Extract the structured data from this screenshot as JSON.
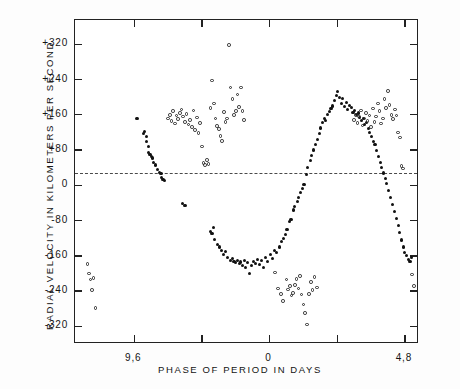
{
  "chart_data": {
    "type": "scatter",
    "title": "",
    "xlabel": "PHASE OF PERIOD IN DAYS",
    "ylabel": "RADIAL VELOCITY IN KILOMETERS PER SECOND",
    "right_label_top": "RECESSION",
    "right_label_bottom": "APPROACH",
    "grid": false,
    "legend": "none",
    "xlim": [
      7.5,
      19.7
    ],
    "ylim": [
      -360,
      375
    ],
    "xticks_values": [
      9.6,
      12.0,
      14.4,
      16.8,
      9.6,
      12.0,
      14.4,
      16.8,
      19.2
    ],
    "xtick_labels": [
      "9,6",
      "0",
      "4,8",
      "9,6",
      "14,4"
    ],
    "xtick_label_positions": [
      9.6,
      14.4,
      19.2,
      24.0,
      28.8
    ],
    "ytick_labels": [
      "+320",
      "+240",
      "+160",
      "+80",
      "0",
      "-80",
      "-160",
      "-240",
      "-320"
    ],
    "ytick_values": [
      320,
      240,
      160,
      80,
      0,
      -80,
      -160,
      -240,
      -320
    ],
    "reference_line": {
      "y": 28,
      "style": "dashed",
      "label": ""
    },
    "series": [
      {
        "name": "filled",
        "marker": "filled-circle",
        "color": "#111111",
        "points": [
          [
            9.7,
            152
          ],
          [
            9.92,
            118
          ],
          [
            9.98,
            122
          ],
          [
            10.02,
            110
          ],
          [
            10.05,
            100
          ],
          [
            10.12,
            74
          ],
          [
            10.16,
            70
          ],
          [
            10.2,
            66
          ],
          [
            10.25,
            62
          ],
          [
            10.1,
            88
          ],
          [
            10.3,
            52
          ],
          [
            10.36,
            46
          ],
          [
            10.44,
            36
          ],
          [
            10.5,
            30
          ],
          [
            10.55,
            26
          ],
          [
            10.58,
            18
          ],
          [
            10.62,
            14
          ],
          [
            10.66,
            10
          ],
          [
            11.3,
            -42
          ],
          [
            11.4,
            -46
          ],
          [
            12.3,
            -104
          ],
          [
            12.36,
            -110
          ],
          [
            12.4,
            -96
          ],
          [
            12.46,
            -122
          ],
          [
            12.55,
            -134
          ],
          [
            12.62,
            -140
          ],
          [
            12.7,
            -148
          ],
          [
            12.78,
            -158
          ],
          [
            12.85,
            -150
          ],
          [
            12.92,
            -164
          ],
          [
            13.0,
            -170
          ],
          [
            13.08,
            -166
          ],
          [
            13.14,
            -172
          ],
          [
            13.2,
            -176
          ],
          [
            13.26,
            -170
          ],
          [
            13.32,
            -178
          ],
          [
            13.38,
            -174
          ],
          [
            13.44,
            -182
          ],
          [
            13.5,
            -170
          ],
          [
            13.56,
            -186
          ],
          [
            13.62,
            -176
          ],
          [
            13.7,
            -200
          ],
          [
            13.76,
            -182
          ],
          [
            13.84,
            -172
          ],
          [
            13.9,
            -178
          ],
          [
            13.96,
            -168
          ],
          [
            14.04,
            -180
          ],
          [
            14.1,
            -170
          ],
          [
            14.18,
            -186
          ],
          [
            14.26,
            -164
          ],
          [
            14.34,
            -172
          ],
          [
            14.42,
            -158
          ],
          [
            14.5,
            -166
          ],
          [
            14.58,
            -148
          ],
          [
            14.66,
            -152
          ],
          [
            14.74,
            -140
          ],
          [
            14.82,
            -128
          ],
          [
            14.88,
            -120
          ],
          [
            14.96,
            -112
          ],
          [
            15.02,
            -100
          ],
          [
            15.1,
            -82
          ],
          [
            15.16,
            -78
          ],
          [
            15.24,
            -56
          ],
          [
            15.3,
            -48
          ],
          [
            15.38,
            -36
          ],
          [
            15.44,
            -28
          ],
          [
            15.5,
            -16
          ],
          [
            15.56,
            -8
          ],
          [
            15.62,
            2
          ],
          [
            15.7,
            24
          ],
          [
            15.76,
            40
          ],
          [
            15.84,
            56
          ],
          [
            15.9,
            68
          ],
          [
            15.96,
            80
          ],
          [
            16.02,
            92
          ],
          [
            16.1,
            104
          ],
          [
            16.16,
            118
          ],
          [
            16.22,
            130
          ],
          [
            16.28,
            142
          ],
          [
            16.34,
            152
          ],
          [
            16.4,
            148
          ],
          [
            16.46,
            160
          ],
          [
            16.52,
            168
          ],
          [
            16.58,
            174
          ],
          [
            16.64,
            180
          ],
          [
            16.7,
            192
          ],
          [
            16.76,
            204
          ],
          [
            16.82,
            212
          ],
          [
            16.88,
            200
          ],
          [
            16.94,
            186
          ],
          [
            17.0,
            196
          ],
          [
            17.06,
            178
          ],
          [
            17.12,
            188
          ],
          [
            17.18,
            172
          ],
          [
            17.24,
            182
          ],
          [
            17.3,
            176
          ],
          [
            17.36,
            166
          ],
          [
            17.42,
            170
          ],
          [
            17.48,
            160
          ],
          [
            17.54,
            164
          ],
          [
            17.6,
            154
          ],
          [
            17.66,
            146
          ],
          [
            17.72,
            152
          ],
          [
            17.78,
            138
          ],
          [
            17.84,
            142
          ],
          [
            17.9,
            128
          ],
          [
            17.96,
            120
          ],
          [
            18.02,
            110
          ],
          [
            18.08,
            100
          ],
          [
            18.14,
            92
          ],
          [
            18.2,
            78
          ],
          [
            18.26,
            66
          ],
          [
            18.32,
            52
          ],
          [
            18.38,
            40
          ],
          [
            18.44,
            28
          ],
          [
            18.5,
            16
          ],
          [
            18.56,
            4
          ],
          [
            18.62,
            -12
          ],
          [
            18.7,
            -28
          ],
          [
            18.76,
            -44
          ],
          [
            18.84,
            -60
          ],
          [
            18.9,
            -76
          ],
          [
            18.96,
            -92
          ],
          [
            19.02,
            -108
          ],
          [
            19.08,
            -124
          ],
          [
            19.14,
            -140
          ],
          [
            19.2,
            -152
          ],
          [
            19.26,
            -160
          ],
          [
            19.32,
            -168
          ],
          [
            19.38,
            -172
          ],
          [
            19.44,
            -164
          ]
        ]
      },
      {
        "name": "open",
        "marker": "open-circle",
        "color": "#2a2a2a",
        "points": [
          [
            7.95,
            -178
          ],
          [
            8.0,
            -200
          ],
          [
            8.05,
            -214
          ],
          [
            8.1,
            -238
          ],
          [
            8.16,
            -210
          ],
          [
            8.22,
            -278
          ],
          [
            10.8,
            152
          ],
          [
            10.86,
            160
          ],
          [
            10.92,
            146
          ],
          [
            10.98,
            168
          ],
          [
            11.04,
            140
          ],
          [
            11.1,
            158
          ],
          [
            11.16,
            150
          ],
          [
            11.22,
            164
          ],
          [
            11.28,
            172
          ],
          [
            11.34,
            156
          ],
          [
            11.4,
            144
          ],
          [
            11.46,
            162
          ],
          [
            11.52,
            138
          ],
          [
            11.58,
            148
          ],
          [
            11.64,
            132
          ],
          [
            11.7,
            170
          ],
          [
            11.76,
            126
          ],
          [
            11.82,
            154
          ],
          [
            11.88,
            118
          ],
          [
            11.94,
            142
          ],
          [
            12.0,
            88
          ],
          [
            12.06,
            50
          ],
          [
            12.12,
            46
          ],
          [
            12.18,
            58
          ],
          [
            12.24,
            48
          ],
          [
            12.3,
            176
          ],
          [
            12.36,
            238
          ],
          [
            12.42,
            186
          ],
          [
            12.48,
            152
          ],
          [
            12.54,
            134
          ],
          [
            12.6,
            128
          ],
          [
            12.66,
            112
          ],
          [
            12.72,
            100
          ],
          [
            12.78,
            166
          ],
          [
            12.84,
            144
          ],
          [
            12.9,
            152
          ],
          [
            12.96,
            318
          ],
          [
            13.02,
            222
          ],
          [
            13.08,
            196
          ],
          [
            13.14,
            160
          ],
          [
            13.2,
            168
          ],
          [
            13.26,
            206
          ],
          [
            13.32,
            178
          ],
          [
            13.38,
            222
          ],
          [
            13.44,
            168
          ],
          [
            13.5,
            148
          ],
          [
            14.6,
            -198
          ],
          [
            14.7,
            -234
          ],
          [
            14.8,
            -246
          ],
          [
            14.88,
            -262
          ],
          [
            15.0,
            -214
          ],
          [
            15.06,
            -236
          ],
          [
            15.12,
            -228
          ],
          [
            15.18,
            -250
          ],
          [
            15.24,
            -244
          ],
          [
            15.3,
            -226
          ],
          [
            15.36,
            -212
          ],
          [
            15.42,
            -234
          ],
          [
            15.48,
            -206
          ],
          [
            15.54,
            -248
          ],
          [
            15.6,
            -270
          ],
          [
            15.66,
            -290
          ],
          [
            15.72,
            -316
          ],
          [
            15.8,
            -246
          ],
          [
            15.86,
            -220
          ],
          [
            15.92,
            -238
          ],
          [
            16.0,
            -208
          ],
          [
            16.08,
            -232
          ],
          [
            17.4,
            148
          ],
          [
            17.46,
            160
          ],
          [
            17.52,
            142
          ],
          [
            17.58,
            156
          ],
          [
            17.64,
            170
          ],
          [
            17.7,
            136
          ],
          [
            17.76,
            152
          ],
          [
            17.82,
            164
          ],
          [
            17.88,
            146
          ],
          [
            17.94,
            158
          ],
          [
            18.0,
            132
          ],
          [
            18.06,
            174
          ],
          [
            18.12,
            144
          ],
          [
            18.18,
            156
          ],
          [
            18.24,
            186
          ],
          [
            18.3,
            168
          ],
          [
            18.36,
            140
          ],
          [
            18.42,
            152
          ],
          [
            18.48,
            196
          ],
          [
            18.54,
            176
          ],
          [
            18.6,
            214
          ],
          [
            18.66,
            182
          ],
          [
            18.72,
            160
          ],
          [
            18.78,
            150
          ],
          [
            18.84,
            172
          ],
          [
            18.9,
            158
          ],
          [
            18.96,
            120
          ],
          [
            19.02,
            108
          ],
          [
            19.08,
            44
          ],
          [
            19.14,
            38
          ],
          [
            19.46,
            -202
          ],
          [
            19.52,
            -228
          ]
        ]
      }
    ]
  }
}
